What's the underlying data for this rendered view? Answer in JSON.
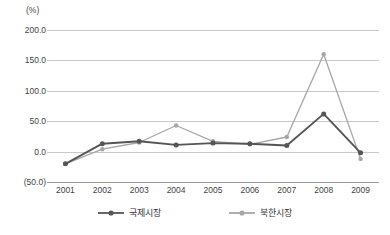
{
  "chart_data": {
    "type": "line",
    "title": "",
    "unit_label": "(%)",
    "xlabel": "",
    "ylabel": "",
    "categories": [
      "2001",
      "2002",
      "2003",
      "2004",
      "2005",
      "2006",
      "2007",
      "2008",
      "2009"
    ],
    "ylim": [
      -50,
      200
    ],
    "yticks": [
      200,
      150,
      100,
      50,
      0,
      -50
    ],
    "ytick_labels": [
      "200.0",
      "150.0",
      "100.0",
      "50.0",
      "0.0",
      "(50.0)"
    ],
    "grid": true,
    "legend_position": "bottom",
    "series": [
      {
        "name": "국제시장",
        "color": "#555555",
        "marker": "circle",
        "values": [
          -20,
          13,
          17,
          11,
          14,
          13,
          10,
          62,
          -2
        ]
      },
      {
        "name": "북한시장",
        "color": "#a6a6a6",
        "marker": "circle",
        "values": [
          -20,
          4,
          15,
          43,
          17,
          12,
          24,
          160,
          -12
        ]
      }
    ]
  },
  "legend": {
    "items": [
      {
        "label": "국제시장",
        "color": "#555555"
      },
      {
        "label": "북한시장",
        "color": "#a6a6a6"
      }
    ]
  }
}
